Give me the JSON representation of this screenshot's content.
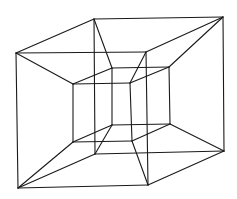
{
  "figure": {
    "stroke_color": "#1a1a1a",
    "background": "#ffffff"
  },
  "vertices": {
    "outer_front_tl": [
      16,
      53
    ],
    "outer_front_tr": [
      146,
      52
    ],
    "outer_front_bl": [
      18,
      188
    ],
    "outer_front_br": [
      148,
      185
    ],
    "outer_back_tl": [
      94,
      19
    ],
    "outer_back_tr": [
      223,
      17
    ],
    "outer_back_bl": [
      95,
      154
    ],
    "outer_back_br": [
      224,
      151
    ],
    "inner_front_tl": [
      73,
      84
    ],
    "inner_front_tr": [
      130,
      83
    ],
    "inner_front_bl": [
      73,
      142
    ],
    "inner_front_br": [
      132,
      141
    ],
    "inner_back_tl": [
      112,
      68
    ],
    "inner_back_tr": [
      169,
      67
    ],
    "inner_back_bl": [
      112,
      125
    ],
    "inner_back_br": [
      170,
      124
    ]
  },
  "edges": [
    [
      "outer_front_tl",
      "outer_front_tr"
    ],
    [
      "outer_front_tr",
      "outer_front_br"
    ],
    [
      "outer_front_br",
      "outer_front_bl"
    ],
    [
      "outer_front_bl",
      "outer_front_tl"
    ],
    [
      "outer_back_tl",
      "outer_back_tr"
    ],
    [
      "outer_back_tr",
      "outer_back_br"
    ],
    [
      "outer_back_br",
      "outer_back_bl"
    ],
    [
      "outer_back_bl",
      "outer_back_tl"
    ],
    [
      "outer_front_tl",
      "outer_back_tl"
    ],
    [
      "outer_front_tr",
      "outer_back_tr"
    ],
    [
      "outer_front_bl",
      "outer_back_bl"
    ],
    [
      "outer_front_br",
      "outer_back_br"
    ],
    [
      "inner_front_tl",
      "inner_front_tr"
    ],
    [
      "inner_front_tr",
      "inner_front_br"
    ],
    [
      "inner_front_br",
      "inner_front_bl"
    ],
    [
      "inner_front_bl",
      "inner_front_tl"
    ],
    [
      "inner_back_tl",
      "inner_back_tr"
    ],
    [
      "inner_back_tr",
      "inner_back_br"
    ],
    [
      "inner_back_br",
      "inner_back_bl"
    ],
    [
      "inner_back_bl",
      "inner_back_tl"
    ],
    [
      "inner_front_tl",
      "inner_back_tl"
    ],
    [
      "inner_front_tr",
      "inner_back_tr"
    ],
    [
      "inner_front_bl",
      "inner_back_bl"
    ],
    [
      "inner_front_br",
      "inner_back_br"
    ],
    [
      "outer_front_tl",
      "inner_front_tl"
    ],
    [
      "outer_front_tr",
      "inner_front_tr"
    ],
    [
      "outer_front_bl",
      "inner_front_bl"
    ],
    [
      "outer_front_br",
      "inner_front_br"
    ],
    [
      "outer_back_tl",
      "inner_back_tl"
    ],
    [
      "outer_back_tr",
      "inner_back_tr"
    ],
    [
      "outer_back_bl",
      "inner_back_bl"
    ],
    [
      "outer_back_br",
      "inner_back_br"
    ]
  ]
}
